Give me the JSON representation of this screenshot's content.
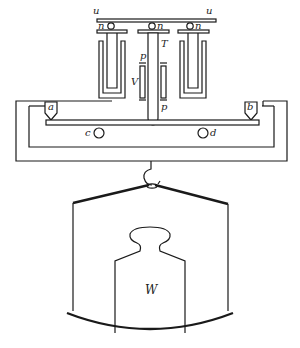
{
  "figure": {
    "type": "balance-apparatus-diagram",
    "line_color": "#1a1a1a",
    "background": "#ffffff"
  },
  "labels": {
    "u_left": "u",
    "u_right": "u",
    "n_left": "n",
    "n_center": "n",
    "n_right": "n",
    "T": "T",
    "p_top": "p",
    "p_bottom": "p",
    "V": "V",
    "a": "a",
    "b": "b",
    "c": "c",
    "d": "d",
    "W": "W"
  }
}
